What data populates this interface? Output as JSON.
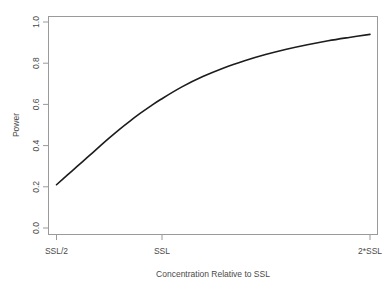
{
  "figure": {
    "title": "",
    "background": "#ffffff",
    "curve_color": "#1c1c1c",
    "axis_color": "#9a9a9a"
  },
  "chart_data": {
    "type": "line",
    "title": "",
    "xlabel": "Concentration Relative to SSL",
    "ylabel": "Power",
    "xlim": [
      0.5,
      2.0
    ],
    "ylim": [
      0.0,
      1.0
    ],
    "grid": false,
    "legend": null,
    "x_tick_labels": [
      "SSL/2",
      "SSL",
      "2*SSL"
    ],
    "x_tick_values": [
      0.5,
      1.0,
      2.0
    ],
    "y_tick_labels": [
      "0.0",
      "0.2",
      "0.4",
      "0.6",
      "0.8",
      "1.0"
    ],
    "y_tick_values": [
      0.0,
      0.2,
      0.4,
      0.6,
      0.8,
      1.0
    ],
    "series": [
      {
        "name": "Power",
        "x": [
          0.5,
          0.55,
          0.6,
          0.65,
          0.7,
          0.75,
          0.8,
          0.85,
          0.9,
          0.95,
          1.0,
          1.1,
          1.2,
          1.3,
          1.4,
          1.5,
          1.6,
          1.7,
          1.8,
          1.9,
          2.0
        ],
        "y": [
          0.21,
          0.255,
          0.3,
          0.345,
          0.39,
          0.435,
          0.478,
          0.518,
          0.556,
          0.592,
          0.625,
          0.685,
          0.735,
          0.777,
          0.812,
          0.842,
          0.868,
          0.89,
          0.909,
          0.925,
          0.94
        ]
      }
    ]
  },
  "axis_labels": {
    "x_title": "Concentration Relative to SSL",
    "y_title": "Power",
    "x_ticks": [
      "SSL/2",
      "SSL",
      "2*SSL"
    ],
    "y_ticks": [
      "0.0",
      "0.2",
      "0.4",
      "0.6",
      "0.8",
      "1.0"
    ]
  }
}
